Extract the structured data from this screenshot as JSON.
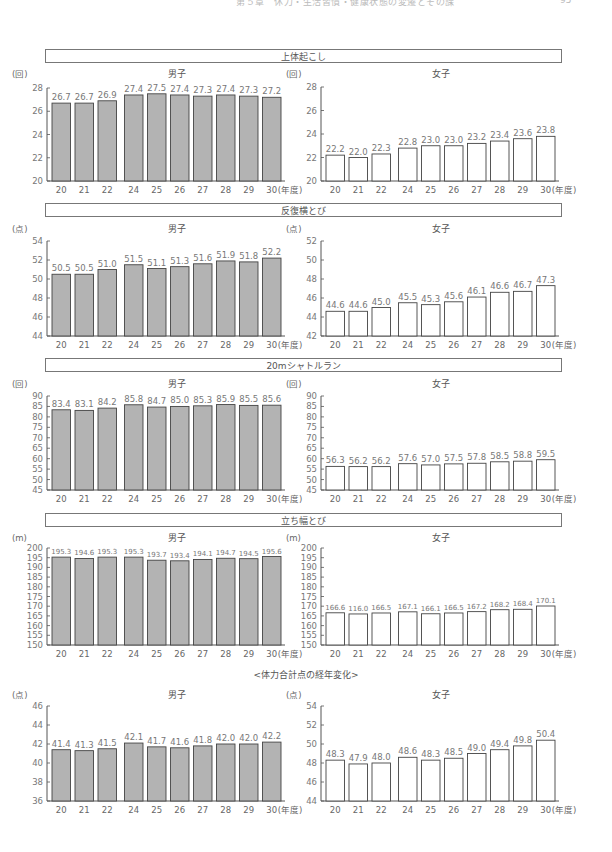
{
  "page_header": {
    "text": "第５章　休力・生活習慣・健康状態の変遷とその課",
    "page_number": "95"
  },
  "years": [
    "20",
    "21",
    "22",
    "24",
    "25",
    "26",
    "27",
    "28",
    "29",
    "30"
  ],
  "x_suffix": "(年度)",
  "chart_data": [
    {
      "type": "bar",
      "section": "上体起こし",
      "title": "男子",
      "ylabel": "(回)",
      "ylim": [
        20,
        28
      ],
      "yticks": [
        20,
        22,
        24,
        26,
        28
      ],
      "categories": [
        "20",
        "21",
        "22",
        "24",
        "25",
        "26",
        "27",
        "28",
        "29",
        "30"
      ],
      "values": [
        26.7,
        26.7,
        26.9,
        27.4,
        27.5,
        27.4,
        27.3,
        27.4,
        27.3,
        27.2
      ],
      "xlabel": "(年度)",
      "fill": "#b3b3b3"
    },
    {
      "type": "bar",
      "section": "上体起こし",
      "title": "女子",
      "ylabel": "(回)",
      "ylim": [
        20,
        28
      ],
      "yticks": [
        20,
        22,
        24,
        26,
        28
      ],
      "categories": [
        "20",
        "21",
        "22",
        "24",
        "25",
        "26",
        "27",
        "28",
        "29",
        "30"
      ],
      "values": [
        22.2,
        22.0,
        22.3,
        22.8,
        23.0,
        23.0,
        23.2,
        23.4,
        23.6,
        23.8
      ],
      "xlabel": "(年度)",
      "fill": "#ffffff"
    },
    {
      "type": "bar",
      "section": "反復横とび",
      "title": "男子",
      "ylabel": "(点)",
      "ylim": [
        44,
        54
      ],
      "yticks": [
        44,
        46,
        48,
        50,
        52,
        54
      ],
      "categories": [
        "20",
        "21",
        "22",
        "24",
        "25",
        "26",
        "27",
        "28",
        "29",
        "30"
      ],
      "values": [
        50.5,
        50.5,
        51.0,
        51.5,
        51.1,
        51.3,
        51.6,
        51.9,
        51.8,
        52.2
      ],
      "xlabel": "(年度)",
      "fill": "#b3b3b3"
    },
    {
      "type": "bar",
      "section": "反復横とび",
      "title": "女子",
      "ylabel": "(点)",
      "ylim": [
        42,
        52
      ],
      "yticks": [
        42,
        44,
        46,
        48,
        50,
        52
      ],
      "categories": [
        "20",
        "21",
        "22",
        "24",
        "25",
        "26",
        "27",
        "28",
        "29",
        "30"
      ],
      "values": [
        44.6,
        44.6,
        45.0,
        45.5,
        45.3,
        45.6,
        46.1,
        46.6,
        46.7,
        47.3
      ],
      "xlabel": "(年度)",
      "fill": "#ffffff"
    },
    {
      "type": "bar",
      "section": "20mシャトルラン",
      "title": "男子",
      "ylabel": "(回)",
      "ylim": [
        45,
        90
      ],
      "yticks": [
        45,
        50,
        55,
        60,
        65,
        70,
        75,
        80,
        85,
        90
      ],
      "categories": [
        "20",
        "21",
        "22",
        "24",
        "25",
        "26",
        "27",
        "28",
        "29",
        "30"
      ],
      "values": [
        83.4,
        83.1,
        84.2,
        85.8,
        84.7,
        85.0,
        85.3,
        85.9,
        85.5,
        85.6
      ],
      "xlabel": "(年度)",
      "fill": "#b3b3b3"
    },
    {
      "type": "bar",
      "section": "20mシャトルラン",
      "title": "女子",
      "ylabel": "(回)",
      "ylim": [
        45,
        90
      ],
      "yticks": [
        45,
        50,
        55,
        60,
        65,
        70,
        75,
        80,
        85,
        90
      ],
      "categories": [
        "20",
        "21",
        "22",
        "24",
        "25",
        "26",
        "27",
        "28",
        "29",
        "30"
      ],
      "values": [
        56.3,
        56.2,
        56.2,
        57.6,
        57.0,
        57.5,
        57.8,
        58.5,
        58.8,
        59.5
      ],
      "xlabel": "(年度)",
      "fill": "#ffffff"
    },
    {
      "type": "bar",
      "section": "立ち幅とび",
      "title": "男子",
      "ylabel": "(m)",
      "ylim": [
        150,
        200
      ],
      "yticks": [
        150,
        155,
        160,
        165,
        170,
        175,
        180,
        185,
        190,
        195,
        200
      ],
      "categories": [
        "20",
        "21",
        "22",
        "24",
        "25",
        "26",
        "27",
        "28",
        "29",
        "30"
      ],
      "values": [
        195.3,
        194.6,
        195.3,
        195.3,
        193.7,
        193.4,
        194.1,
        194.7,
        194.5,
        195.6
      ],
      "xlabel": "(年度)",
      "fill": "#b3b3b3"
    },
    {
      "type": "bar",
      "section": "立ち幅とび",
      "title": "女子",
      "ylabel": "(m)",
      "ylim": [
        150,
        200
      ],
      "yticks": [
        150,
        155,
        160,
        165,
        170,
        175,
        180,
        185,
        190,
        195,
        200
      ],
      "categories": [
        "20",
        "21",
        "22",
        "24",
        "25",
        "26",
        "27",
        "28",
        "29",
        "30"
      ],
      "values": [
        166.6,
        166.0,
        166.5,
        167.1,
        166.1,
        166.5,
        167.2,
        168.2,
        168.4,
        170.1
      ],
      "labels": [
        "166.6",
        "116.0",
        "166.5",
        "167.1",
        "166.1",
        "166.5",
        "167.2",
        "168.2",
        "168.4",
        "170.1"
      ],
      "xlabel": "(年度)",
      "fill": "#ffffff"
    },
    {
      "type": "bar",
      "section": "<体力合計点の経年変化>",
      "title": "男子",
      "ylabel": "(点)",
      "ylim": [
        36,
        46
      ],
      "yticks": [
        36,
        38,
        40,
        42,
        44,
        46
      ],
      "categories": [
        "20",
        "21",
        "22",
        "24",
        "25",
        "26",
        "27",
        "28",
        "29",
        "30"
      ],
      "values": [
        41.4,
        41.3,
        41.5,
        42.1,
        41.7,
        41.6,
        41.8,
        42.0,
        42.0,
        42.2
      ],
      "xlabel": "(年度)",
      "fill": "#b3b3b3"
    },
    {
      "type": "bar",
      "section": "<体力合計点の経年変化>",
      "title": "女子",
      "ylabel": "(点)",
      "ylim": [
        44,
        54
      ],
      "yticks": [
        44,
        46,
        48,
        50,
        52,
        54
      ],
      "categories": [
        "20",
        "21",
        "22",
        "24",
        "25",
        "26",
        "27",
        "28",
        "29",
        "30"
      ],
      "values": [
        48.3,
        47.9,
        48.0,
        48.6,
        48.3,
        48.5,
        49.0,
        49.4,
        49.8,
        50.4
      ],
      "xlabel": "(年度)",
      "fill": "#ffffff"
    }
  ],
  "sections": [
    {
      "title": "上体起こし",
      "boxed": true
    },
    {
      "title": "反復横とび",
      "boxed": true
    },
    {
      "title": "20mシャトルラン",
      "boxed": true
    },
    {
      "title": "立ち幅とび",
      "boxed": true
    },
    {
      "title": "<体力合計点の経年変化>",
      "boxed": false
    }
  ],
  "genders": {
    "male": "男子",
    "female": "女子"
  }
}
